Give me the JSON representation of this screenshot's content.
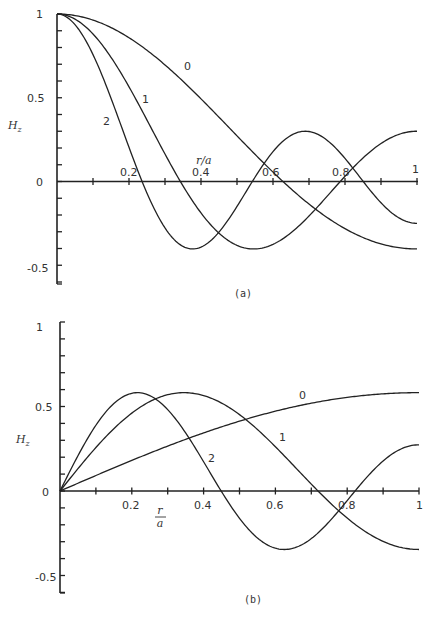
{
  "chart_data": [
    {
      "panel": "(a)",
      "type": "line",
      "title": "",
      "xlabel": "r/a",
      "ylabel": "H_z",
      "xlim": [
        0,
        1
      ],
      "ylim": [
        -0.6,
        1
      ],
      "grid": false,
      "legend": "inline curve labels",
      "x_ticks": [
        0.1,
        0.2,
        0.3,
        0.4,
        0.5,
        0.6,
        0.7,
        0.8,
        0.9,
        1.0
      ],
      "x_tick_labels": {
        "0.2": "0.2",
        "0.4": "0.4",
        "0.6": "0.6",
        "0.8": "0.8",
        "1": "1"
      },
      "y_ticks": [
        -0.6,
        -0.5,
        -0.4,
        -0.3,
        -0.2,
        -0.1,
        0,
        0.1,
        0.2,
        0.3,
        0.4,
        0.5,
        0.6,
        0.7,
        0.8,
        0.9,
        1.0
      ],
      "y_tick_labels": {
        "1": "1",
        "0.5": "0.5",
        "0": "0",
        "-0.5": "-0.5"
      },
      "x": [
        0,
        0.1,
        0.2,
        0.3,
        0.4,
        0.5,
        0.6,
        0.7,
        0.8,
        0.9,
        1.0
      ],
      "series": [
        {
          "name": "0",
          "k": 3.832,
          "func": "J0",
          "values": [
            1.0,
            0.964,
            0.861,
            0.704,
            0.512,
            0.306,
            0.108,
            -0.065,
            -0.199,
            -0.286,
            -0.403
          ]
        },
        {
          "name": "1",
          "k": 7.016,
          "func": "J0",
          "values": [
            1.0,
            0.882,
            0.567,
            0.165,
            -0.185,
            -0.374,
            -0.343,
            -0.125,
            0.13,
            0.296,
            0.3
          ]
        },
        {
          "name": "2",
          "k": 10.173,
          "func": "J0",
          "values": [
            1.0,
            0.759,
            0.167,
            -0.3,
            -0.334,
            0.001,
            0.276,
            0.196,
            -0.1,
            -0.249,
            -0.25
          ]
        }
      ]
    },
    {
      "panel": "(b)",
      "type": "line",
      "title": "",
      "xlabel": "r/a",
      "ylabel": "H_z",
      "xlim": [
        0,
        1
      ],
      "ylim": [
        -0.6,
        1
      ],
      "grid": false,
      "legend": "inline curve labels",
      "x_ticks": [
        0.1,
        0.2,
        0.3,
        0.4,
        0.5,
        0.6,
        0.7,
        0.8,
        0.9,
        1.0
      ],
      "x_tick_labels": {
        "0.2": "0.2",
        "0.4": "0.4",
        "0.6": "0.6",
        "0.8": "0.8",
        "1": "1"
      },
      "y_ticks": [
        -0.6,
        -0.5,
        -0.4,
        -0.3,
        -0.2,
        -0.1,
        0,
        0.1,
        0.2,
        0.3,
        0.4,
        0.5,
        0.6,
        0.7,
        0.8,
        0.9,
        1.0
      ],
      "y_tick_labels": {
        "1": "1",
        "0.5": "0.5",
        "0": "0",
        "-0.5": "-0.5"
      },
      "x": [
        0,
        0.1,
        0.2,
        0.3,
        0.4,
        0.5,
        0.6,
        0.7,
        0.8,
        0.9,
        1.0
      ],
      "series": [
        {
          "name": "0",
          "k": 1.841,
          "func": "J1",
          "values": [
            0.0,
            0.092,
            0.18,
            0.262,
            0.336,
            0.4,
            0.454,
            0.502,
            0.539,
            0.565,
            0.582
          ]
        },
        {
          "name": "1",
          "k": 5.331,
          "func": "J1",
          "values": [
            0.0,
            0.262,
            0.46,
            0.569,
            0.571,
            0.462,
            0.272,
            0.03,
            -0.196,
            -0.344,
            -0.346
          ]
        },
        {
          "name": "2",
          "k": 8.536,
          "func": "J1",
          "values": [
            0.0,
            0.398,
            0.574,
            0.348,
            -0.039,
            -0.291,
            -0.306,
            -0.085,
            0.175,
            0.295,
            0.3
          ]
        }
      ]
    }
  ],
  "panels": {
    "a": {
      "caption": "(a)",
      "ylabel": "H",
      "ylabel_sub": "z",
      "xlabel": "r/a",
      "y_tick_labels": [
        "1",
        "0.5",
        "0",
        "-0.5"
      ],
      "x_tick_labels": [
        "0.2",
        "0.4",
        "0.6",
        "0.8",
        "1"
      ],
      "curve_labels": [
        "0",
        "1",
        "2"
      ]
    },
    "b": {
      "caption": "(b)",
      "ylabel": "H",
      "ylabel_sub": "z",
      "xlabel_num": "r",
      "xlabel_den": "a",
      "y_tick_labels": [
        "1",
        "0.5",
        "0",
        "-0.5"
      ],
      "x_tick_labels": [
        "0.2",
        "0.4",
        "0.6",
        "0.8",
        "1"
      ],
      "curve_labels": [
        "0",
        "1",
        "2"
      ]
    }
  }
}
